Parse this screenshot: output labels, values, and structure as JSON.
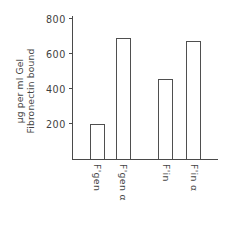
{
  "chart_data": {
    "type": "bar",
    "title": "",
    "xlabel": "",
    "ylabel_lines": [
      "Fibronectin bound",
      "µg per ml Gel"
    ],
    "ylabel": "Fibronectin bound µg per ml Gel",
    "categories": [
      "F'gen",
      "F'gen α",
      "F'in",
      "F'in α"
    ],
    "values": [
      200,
      690,
      460,
      675
    ],
    "ylim": [
      0,
      800
    ],
    "yticks": [
      200,
      400,
      600,
      800
    ],
    "ytick_labels": [
      "200",
      "400",
      "600",
      "800"
    ],
    "grid": false,
    "legend": false,
    "bar_color": "#ffffff",
    "bar_edge_color": "#4f4f4f",
    "axis_color": "#4a4a4a",
    "background": "#ffffff",
    "group_gap_after_index": 1
  },
  "axis": {
    "yticks": [
      {
        "label": "800",
        "value": 800
      },
      {
        "label": "600",
        "value": 600
      },
      {
        "label": "400",
        "value": 400
      },
      {
        "label": "200",
        "value": 200
      }
    ]
  },
  "bars": [
    {
      "label": "F'gen",
      "value": 200,
      "left_pct": 12.0,
      "width_pct": 10.5
    },
    {
      "label": "F'gen α",
      "value": 690,
      "left_pct": 30.0,
      "width_pct": 10.5
    },
    {
      "label": "F'in",
      "value": 460,
      "left_pct": 59.0,
      "width_pct": 10.5
    },
    {
      "label": "F'in α",
      "value": 675,
      "left_pct": 78.0,
      "width_pct": 10.5
    }
  ]
}
